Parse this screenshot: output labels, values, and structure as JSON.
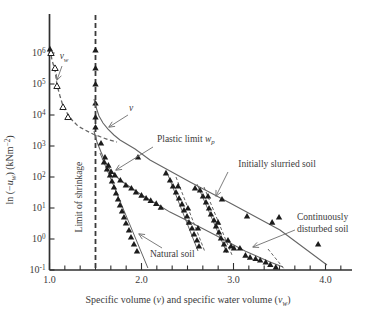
{
  "figure_title": "Soil suction versus specific volume drying curves",
  "colors": {
    "paper": "#ffffff",
    "axis": "#2f2f2f",
    "curve": "#656565",
    "marker": "#1c1c1c",
    "text": "#3b3b3b",
    "arrow": "#6e6e6e"
  },
  "chart_data": {
    "type": "scatter",
    "title": "",
    "xlabel_segments": [
      {
        "t": "Specific volume ("
      },
      {
        "t": "v",
        "i": 1
      },
      {
        "t": ") and specific water volume ("
      },
      {
        "t": "v",
        "i": 1
      },
      {
        "t": "w",
        "i": 1,
        "b": 1
      },
      {
        "t": ")"
      }
    ],
    "ylabel_segments": [
      {
        "t": "ln (−"
      },
      {
        "t": "u",
        "i": 1
      },
      {
        "t": "w",
        "i": 1,
        "b": 1
      },
      {
        "t": ") (kNm"
      },
      {
        "t": "−2",
        "p": 1
      },
      {
        "t": ")"
      }
    ],
    "xlim": [
      1.0,
      4.3
    ],
    "ylim_log10": [
      -1,
      7.2
    ],
    "grid": false,
    "legend": "none",
    "x_ticks": [
      {
        "v": 1,
        "label": "1.0"
      },
      {
        "v": 2,
        "label": "2.0"
      },
      {
        "v": 3,
        "label": "3.0"
      },
      {
        "v": 4,
        "label": "4.0"
      }
    ],
    "x_minor_divisions_per_unit": 6,
    "y_tick_exponents": [
      6,
      5,
      4,
      3,
      2,
      1,
      0,
      -1
    ],
    "series": [
      {
        "id": "vw-drying-curve",
        "name": "specific water volume drying curve",
        "style": "dashed",
        "width": 1.3,
        "line": [
          [
            1.005,
            1350000
          ],
          [
            1.027,
            590000
          ],
          [
            1.06,
            280000
          ],
          [
            1.0815,
            93000
          ],
          [
            1.114,
            41000
          ],
          [
            1.147,
            19500
          ],
          [
            1.19,
            11600
          ],
          [
            1.245,
            6900
          ],
          [
            1.31,
            4400
          ],
          [
            1.386,
            3280
          ],
          [
            1.473,
            2440
          ],
          [
            1.56,
            1950
          ],
          [
            1.647,
            1560
          ],
          [
            1.734,
            1350
          ]
        ],
        "markers_open": [
          [
            1.016,
            1000000
          ],
          [
            1.06,
            328000
          ],
          [
            1.0815,
            86000
          ],
          [
            1.147,
            18100
          ],
          [
            1.201,
            8600
          ]
        ],
        "markers_filled": [
          [
            1.005,
            1350000
          ]
        ]
      },
      {
        "id": "shrinkage-limit-line",
        "name": "limit of shrinkage vertical line at v = 1.5",
        "style": "dashed-bold",
        "width": 1.8,
        "stroke": "#3a3a3a",
        "line": [
          [
            1.5,
            17000000
          ],
          [
            1.5,
            0.1
          ]
        ],
        "markers_filled": [
          [
            1.5,
            1250000
          ],
          [
            1.5,
            328000
          ],
          [
            1.5,
            100000
          ],
          [
            1.5,
            24400
          ],
          [
            1.5,
            8600
          ],
          [
            1.5,
            4100
          ]
        ]
      },
      {
        "id": "v-curve-initially-slurried",
        "name": "specific volume curve / initially slurried soil line",
        "style": "solid",
        "width": 1.1,
        "line": [
          [
            1.484,
            32800
          ],
          [
            1.505,
            18100
          ],
          [
            1.538,
            9300
          ],
          [
            1.582,
            5500
          ],
          [
            1.636,
            3500
          ],
          [
            1.7,
            2260
          ],
          [
            1.766,
            1560
          ],
          [
            1.93,
            800
          ],
          [
            2.092,
            353
          ],
          [
            2.527,
            69
          ],
          [
            2.962,
            14.5
          ],
          [
            3.505,
            1.95
          ],
          [
            4.016,
            0.145
          ]
        ],
        "markers_filled": [
          [
            1.962,
            442
          ],
          [
            2.266,
            135
          ],
          [
            2.582,
            44
          ],
          [
            2.875,
            19.5
          ],
          [
            3.147,
            5.5
          ],
          [
            3.42,
            3.5
          ],
          [
            3.495,
            5.1
          ],
          [
            3.92,
            0.69
          ]
        ]
      },
      {
        "id": "continuously-disturbed-curve",
        "name": "continuously disturbed soil line",
        "style": "solid",
        "width": 1.1,
        "line": [
          [
            1.484,
            3050
          ],
          [
            1.516,
            1350
          ],
          [
            1.56,
            640
          ],
          [
            1.603,
            328
          ],
          [
            1.647,
            195
          ],
          [
            1.7,
            125
          ],
          [
            1.766,
            80
          ],
          [
            1.875,
            47.5
          ],
          [
            2.005,
            26
          ],
          [
            2.147,
            14.5
          ],
          [
            2.31,
            7.4
          ],
          [
            2.527,
            3.5
          ],
          [
            2.8,
            1.35
          ],
          [
            3.125,
            0.41
          ],
          [
            3.397,
            0.18
          ],
          [
            3.538,
            0.125
          ]
        ],
        "markers_filled": [
          [
            1.56,
            1250
          ],
          [
            1.603,
            440
          ],
          [
            1.64,
            240
          ],
          [
            1.67,
            150
          ],
          [
            1.71,
            117
          ],
          [
            1.77,
            80
          ],
          [
            1.83,
            55
          ],
          [
            1.89,
            44
          ],
          [
            1.94,
            33
          ],
          [
            2.0,
            26
          ],
          [
            2.05,
            21
          ],
          [
            2.1,
            17.5
          ],
          [
            2.16,
            14
          ],
          [
            2.21,
            10.5
          ],
          [
            3.07,
            0.51
          ],
          [
            3.13,
            0.3
          ],
          [
            3.18,
            0.26
          ],
          [
            3.24,
            0.235
          ],
          [
            3.29,
            0.21
          ],
          [
            3.35,
            0.18
          ],
          [
            3.4,
            0.15
          ],
          [
            3.46,
            0.125
          ]
        ]
      },
      {
        "id": "natural-soil-line",
        "name": "natural soil line",
        "style": "solid",
        "width": 1.0,
        "line": [
          [
            1.549,
            594
          ],
          [
            2.07,
            0.116
          ]
        ],
        "markers_filled": [
          [
            1.592,
            305
          ],
          [
            1.625,
            181
          ],
          [
            1.658,
            116
          ],
          [
            1.679,
            74
          ],
          [
            1.701,
            47.5
          ],
          [
            1.723,
            30.5
          ],
          [
            1.745,
            19.5
          ],
          [
            1.766,
            12.5
          ],
          [
            1.788,
            8
          ],
          [
            1.81,
            5.1
          ],
          [
            1.831,
            3.28
          ],
          [
            1.864,
            1.95
          ],
          [
            1.886,
            1.16
          ],
          [
            1.918,
            0.69
          ],
          [
            1.951,
            0.41
          ]
        ]
      },
      {
        "id": "drying-path-a",
        "name": "drying path",
        "style": "solid",
        "width": 1.0,
        "line": [
          [
            2.288,
            116
          ],
          [
            2.614,
            0.41
          ]
        ]
      },
      {
        "id": "drying-path-b",
        "name": "drying path",
        "style": "dashed-fine",
        "width": 1.0,
        "line": [
          [
            2.375,
            100
          ],
          [
            2.69,
            0.38
          ]
        ]
      },
      {
        "id": "drying-path-c",
        "name": "drying path",
        "style": "solid",
        "width": 1.0,
        "line": [
          [
            2.603,
            59
          ],
          [
            2.929,
            0.353
          ]
        ]
      },
      {
        "id": "drying-path-d",
        "name": "drying path",
        "style": "dashed-fine",
        "width": 1.0,
        "line": [
          [
            2.679,
            47.5
          ],
          [
            2.984,
            0.305
          ]
        ]
      },
      {
        "id": "drying-path-e",
        "name": "drying path",
        "style": "dashed-fine",
        "width": 1.0,
        "line": [
          [
            3.375,
            0.475
          ],
          [
            3.56,
            0.1
          ]
        ]
      },
      {
        "id": "drying-path-scatter",
        "name": "drying path data points",
        "style": "none",
        "markers_filled": [
          [
            2.31,
            80
          ],
          [
            2.342,
            51
          ],
          [
            2.375,
            32.8
          ],
          [
            2.408,
            21
          ],
          [
            2.44,
            13.5
          ],
          [
            2.462,
            8.6
          ],
          [
            2.495,
            5.5
          ],
          [
            2.516,
            3.5
          ],
          [
            2.549,
            2.26
          ],
          [
            2.571,
            1.45
          ],
          [
            2.603,
            0.93
          ],
          [
            2.625,
            0.59
          ],
          [
            2.636,
            38
          ],
          [
            2.668,
            24.4
          ],
          [
            2.701,
            15.6
          ],
          [
            2.734,
            10
          ],
          [
            2.755,
            6.4
          ],
          [
            2.788,
            4.1
          ],
          [
            2.81,
            2.62
          ],
          [
            2.842,
            1.68
          ],
          [
            2.864,
            1.08
          ],
          [
            2.897,
            0.69
          ],
          [
            2.918,
            0.44
          ],
          [
            2.397,
            51
          ],
          [
            2.505,
            10
          ],
          [
            2.614,
            2.26
          ],
          [
            2.723,
            24.4
          ],
          [
            2.832,
            3.5
          ],
          [
            2.94,
            0.93
          ],
          [
            2.973,
            0.59
          ],
          [
            3.005,
            0.51
          ]
        ]
      }
    ],
    "annotations": [
      {
        "id": "vw-label",
        "segments": [
          {
            "t": "v",
            "i": 1
          },
          {
            "t": "w",
            "i": 1,
            "b": 1
          }
        ],
        "x": 1.158,
        "s": 640000,
        "anchor": "middle",
        "arrow": [
          [
            1.136,
            380000
          ],
          [
            1.0815,
            135000
          ]
        ]
      },
      {
        "id": "v-label",
        "segments": [
          {
            "t": "v",
            "i": 1
          }
        ],
        "x": 1.886,
        "s": 13500,
        "anchor": "middle",
        "arrow": [
          [
            1.853,
            10000
          ],
          [
            1.647,
            4100
          ]
        ]
      },
      {
        "id": "plastic-limit-label",
        "segments": [
          {
            "t": "Plastic limit "
          },
          {
            "t": "w",
            "i": 1
          },
          {
            "t": "p",
            "i": 1,
            "b": 1
          }
        ],
        "x": 2.168,
        "s": 1350,
        "anchor": "start",
        "arrow": [
          [
            2.125,
            929
          ],
          [
            1.723,
            168
          ]
        ]
      },
      {
        "id": "shrinkage-limit-label",
        "segments": [
          {
            "t": "Limit of shrinkage"
          }
        ],
        "x": 1.353,
        "s": 22.6,
        "anchor": "middle",
        "rotate": -90
      },
      {
        "id": "initially-slurried-label",
        "segments": [
          {
            "t": "Initially slurried soil"
          }
        ],
        "x": 3.473,
        "s": 210,
        "anchor": "middle",
        "arrow": [
          [
            2.94,
            145
          ],
          [
            2.81,
            24.4
          ]
        ]
      },
      {
        "id": "continuously-disturbed-label-1",
        "segments": [
          {
            "t": "Continuously"
          }
        ],
        "x": 3.69,
        "s": 4.1,
        "anchor": "start",
        "arrow": [
          [
            3.668,
            1.95
          ],
          [
            3.212,
            0.552
          ]
        ]
      },
      {
        "id": "continuously-disturbed-label-2",
        "segments": [
          {
            "t": "disturbed soil"
          }
        ],
        "x": 3.69,
        "s": 1.68,
        "anchor": "start"
      },
      {
        "id": "natural-soil-label",
        "segments": [
          {
            "t": "Natural soil"
          }
        ],
        "x": 2.092,
        "s": 0.263,
        "anchor": "start",
        "arrow": [
          [
            2.223,
            0.513
          ],
          [
            1.973,
            1.45
          ]
        ]
      }
    ]
  }
}
